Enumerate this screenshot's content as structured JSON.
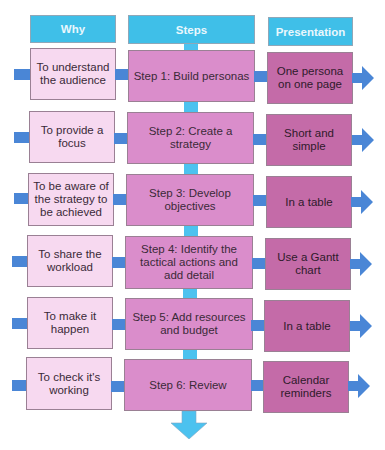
{
  "headers": {
    "why": "Why",
    "steps": "Steps",
    "presentation": "Presentation"
  },
  "rows": [
    {
      "why": "To understand the audience",
      "step": "Step 1: Build personas",
      "presentation": "One persona on one page"
    },
    {
      "why": "To provide a focus",
      "step": "Step 2: Create a strategy",
      "presentation": "Short and simple"
    },
    {
      "why": "To be aware of the strategy to be achieved",
      "step": "Step 3: Develop objectives",
      "presentation": "In a table"
    },
    {
      "why": "To share the workload",
      "step": "Step 4: Identify the tactical actions and add detail",
      "presentation": "Use a Gantt chart"
    },
    {
      "why": "To make it happen",
      "step": "Step 5: Add resources and budget",
      "presentation": "In a table"
    },
    {
      "why": "To check it's working",
      "step": "Step 6: Review",
      "presentation": "Calendar reminders"
    }
  ],
  "colors": {
    "header": "#3fbfe8",
    "why_box": "#f7d9f0",
    "step_box": "#da8dcb",
    "presentation_box": "#c46ba8",
    "horizontal_connector": "#4a86d6",
    "vertical_connector": "#4cc2ef"
  },
  "icons": {
    "row_arrow": "right-arrow-icon",
    "flow_end_arrow": "down-arrow-icon"
  }
}
